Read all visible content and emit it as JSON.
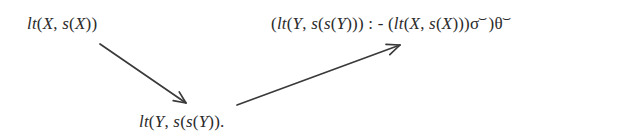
{
  "figure": {
    "background_color": "#ffffff",
    "ink_color": "#2b2b2b",
    "arrow_color": "#3a3a3a"
  },
  "nodes": {
    "top_left": {
      "text": "lt(X, s(X))",
      "parts": {
        "p1": "lt",
        "p2": "(",
        "p3": "X",
        "p4": ", ",
        "p5": "s",
        "p6": "(",
        "p7": "X",
        "p8": "))"
      }
    },
    "top_right": {
      "text": "(lt(Y, s(s(Y))) : - (lt(X, s(X)))σ⌣)θ⌣",
      "parts": {
        "open": "(",
        "head_fn": "lt",
        "head_open": "(",
        "head_arg1": "Y",
        "head_comma": ", ",
        "head_s1": "s",
        "head_s1_open": "(",
        "head_s2": "s",
        "head_s2_open": "(",
        "head_arg2": "Y",
        "head_close": ")))",
        "neck": " : - ",
        "body_open": "(",
        "body_fn": "lt",
        "body_open2": "(",
        "body_arg1": "X",
        "body_comma": ", ",
        "body_s": "s",
        "body_s_open": "(",
        "body_arg2": "X",
        "body_close": ")))",
        "sigma": "σ",
        "sigma_accent": "⌣",
        "close_paren": ")",
        "theta": "θ",
        "theta_accent": "⌣"
      }
    },
    "bottom": {
      "text": "lt(Y, s(s(Y)).",
      "parts": {
        "p1": "lt",
        "p2": "(",
        "p3": "Y",
        "p4": ", ",
        "p5": "s",
        "p6": "(",
        "p7": "s",
        "p8": "(",
        "p9": "Y",
        "p10": "))."
      }
    }
  },
  "arrows": {
    "descending": {
      "label": "arrow-from-top-left-to-bottom",
      "from_x": 100,
      "from_y": 44,
      "to_x": 186,
      "to_y": 103
    },
    "ascending": {
      "label": "arrow-from-bottom-to-top-right",
      "from_x": 237,
      "from_y": 105,
      "to_x": 400,
      "to_y": 45
    }
  }
}
